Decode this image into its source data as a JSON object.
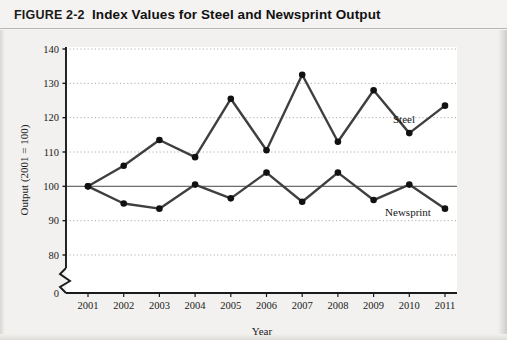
{
  "figure": {
    "label": "FIGURE 2-2",
    "title": "Index Values for Steel and Newsprint Output"
  },
  "chart_data": {
    "type": "line",
    "title": "Index Values for Steel and Newsprint Output",
    "xlabel": "Year",
    "ylabel": "Output (2001 = 100)",
    "categories": [
      "2001",
      "2002",
      "2003",
      "2004",
      "2005",
      "2006",
      "2007",
      "2008",
      "2009",
      "2010",
      "2011"
    ],
    "x": [
      2001,
      2002,
      2003,
      2004,
      2005,
      2006,
      2007,
      2008,
      2009,
      2010,
      2011
    ],
    "series": [
      {
        "name": "Steel",
        "color": "#3f3f3f",
        "values": [
          100,
          106,
          113.5,
          108.5,
          125.5,
          110.5,
          132.5,
          113,
          128,
          115.5,
          123.5
        ]
      },
      {
        "name": "Newsprint",
        "color": "#3f3f3f",
        "values": [
          100,
          95,
          93.5,
          100.5,
          96.5,
          104,
          95.5,
          104,
          96,
          100.5,
          93.5
        ]
      }
    ],
    "ylim": [
      80,
      140
    ],
    "yticks": [
      0,
      80,
      90,
      100,
      110,
      120,
      130,
      140
    ],
    "ytick_labels": [
      "0",
      "80",
      "90",
      "100",
      "110",
      "120",
      "130",
      "140"
    ],
    "axis_break": true,
    "grid": "horizontal-dotted",
    "reference_line": 100,
    "legend_position": "inline-right"
  },
  "annotations": {
    "steel_label": "Steel",
    "newsprint_label": "Newsprint"
  }
}
